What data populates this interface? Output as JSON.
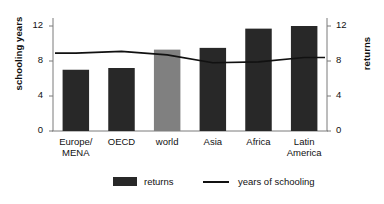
{
  "chart_data": {
    "type": "bar",
    "title": "",
    "xlabel": "",
    "ylabel": "schooling years",
    "ylabel_right": "returns",
    "ylim": [
      0,
      12
    ],
    "yticks": [
      "0",
      "4",
      "8",
      "12"
    ],
    "ytick_values": [
      0,
      4,
      8,
      12
    ],
    "grid": false,
    "legend_position": "bottom",
    "categories": [
      "Europe/\nMENA",
      "OECD",
      "world",
      "Asia",
      "Africa",
      "Latin\nAmerica"
    ],
    "series": [
      {
        "name": "returns",
        "chart_type": "bar",
        "axis": "right",
        "values": [
          7.0,
          7.2,
          9.3,
          9.5,
          11.7,
          12.0
        ],
        "colors": [
          "#282828",
          "#282828",
          "#808080",
          "#282828",
          "#282828",
          "#282828"
        ]
      },
      {
        "name": "years of schooling",
        "chart_type": "line",
        "axis": "left",
        "values": [
          8.9,
          9.1,
          8.7,
          7.8,
          7.9,
          8.4
        ],
        "color": "#111111"
      }
    ]
  },
  "legend": {
    "items": [
      {
        "label": "returns",
        "marker": "bar-swatch-icon",
        "color": "#282828"
      },
      {
        "label": "years of schooling",
        "marker": "line-swatch-icon",
        "color": "#111111"
      }
    ]
  },
  "colors": {
    "bar_default": "#282828",
    "bar_highlight": "#808080",
    "line": "#111111",
    "axis": "#7a7a7a",
    "background": "#ffffff"
  }
}
